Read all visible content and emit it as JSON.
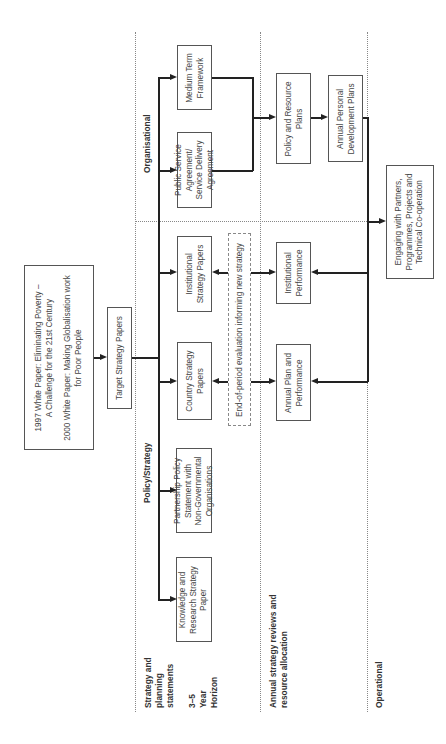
{
  "diagram": {
    "orientation": "rotated-90-ccw",
    "rows": {
      "strategy": {
        "label_lines": [
          "Strategy and",
          "planning",
          "statements"
        ],
        "horizon_lines": [
          "3–5",
          "Year",
          "Horizon"
        ]
      },
      "annual": {
        "label_lines": [
          "Annual strategy reviews and",
          "resource allocation"
        ]
      },
      "operational": {
        "label": "Operational"
      }
    },
    "sections": {
      "policy_strategy": "Policy/Strategy",
      "organisational": "Organisational"
    },
    "nodes": {
      "white_papers": {
        "line1": "1997 White Paper: Eliminating Poverty –",
        "line2": "A Challenge for the 21st Century",
        "line3": "2000 White Paper: Making Globalisation work",
        "line4": "for Poor People"
      },
      "target_strategy": {
        "lines": [
          "Target Strategy Papers"
        ]
      },
      "knowledge_research": {
        "lines": [
          "Knowledge and",
          "Research Strategy",
          "Paper"
        ]
      },
      "partnership_policy": {
        "lines": [
          "Partnership Policy",
          "Statement with",
          "Non-Governmental",
          "Organisations"
        ]
      },
      "country_strategy": {
        "lines": [
          "Country Strategy",
          "Papers"
        ]
      },
      "institutional_strategy": {
        "lines": [
          "Institutional",
          "Strategy Papers"
        ]
      },
      "psa": {
        "lines": [
          "Public Service",
          "Agreement/",
          "Service Delivery",
          "Agreement"
        ]
      },
      "medium_term": {
        "lines": [
          "Medium Term",
          "Framework"
        ]
      },
      "evaluation": {
        "lines": [
          "End-of-period evaluation informing new strategy"
        ]
      },
      "annual_plan": {
        "lines": [
          "Annual Plan and",
          "Performance"
        ]
      },
      "institutional_performance": {
        "lines": [
          "Institutional",
          "Performance"
        ]
      },
      "policy_resource": {
        "lines": [
          "Policy and Resource",
          "Plans"
        ]
      },
      "annual_personal": {
        "lines": [
          "Annual Personal",
          "Development Plans"
        ]
      },
      "engaging": {
        "lines": [
          "Engaging with Partners,",
          "Programmes, Projects and",
          "Technical Co-operation"
        ]
      }
    },
    "colors": {
      "line": "#222222",
      "box_border": "#555555",
      "divider": "#888888",
      "text": "#444444"
    }
  }
}
